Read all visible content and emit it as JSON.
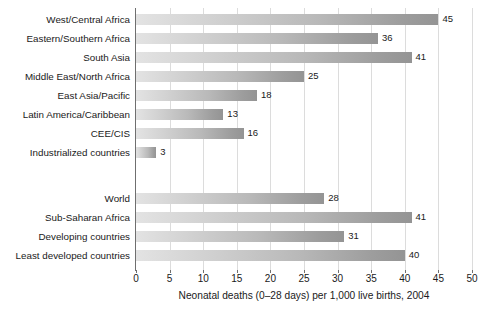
{
  "chart_data": {
    "type": "bar",
    "orientation": "horizontal",
    "title": "",
    "subtitle": "",
    "xlabel": "Neonatal deaths (0–28 days) per 1,000 live births, 2004",
    "ylabel": "",
    "xlim": [
      0,
      50
    ],
    "xticks": [
      0,
      5,
      10,
      15,
      20,
      25,
      30,
      35,
      40,
      45,
      50
    ],
    "xtick_labels": [
      "0",
      "5",
      "10",
      "15",
      "20",
      "25",
      "30",
      "35",
      "40",
      "45",
      "50"
    ],
    "grid": "vertical",
    "legend": "none",
    "bar_color": "#b0b0b0",
    "bar_color_light": "#e3e3e3",
    "bar_color_dark": "#949494",
    "axis_color": "#6f6f6f",
    "gridline_color": "#dcdcdc",
    "categories": [
      "West/Central Africa",
      "Eastern/Southern Africa",
      "South Asia",
      "Middle East/North Africa",
      "East Asia/Pacific",
      "Latin America/Caribbean",
      "CEE/CIS",
      "Industrialized countries",
      "World",
      "Sub-Saharan Africa",
      "Developing countries",
      "Least developed countries"
    ],
    "values": [
      45,
      36,
      41,
      25,
      18,
      13,
      16,
      3,
      28,
      41,
      31,
      40
    ],
    "value_labels": [
      "45",
      "36",
      "41",
      "25",
      "18",
      "13",
      "16",
      "3",
      "28",
      "41",
      "31",
      "40"
    ],
    "groups": [
      {
        "name": "regions",
        "categories": [
          "West/Central Africa",
          "Eastern/Southern Africa",
          "South Asia",
          "Middle East/North Africa",
          "East Asia/Pacific",
          "Latin America/Caribbean",
          "CEE/CIS",
          "Industrialized countries"
        ],
        "values": [
          45,
          36,
          41,
          25,
          18,
          13,
          16,
          3
        ]
      },
      {
        "name": "aggregates",
        "categories": [
          "World",
          "Sub-Saharan Africa",
          "Developing countries",
          "Least developed countries"
        ],
        "values": [
          28,
          41,
          31,
          40
        ]
      }
    ],
    "rows": [
      {
        "label": "West/Central Africa",
        "value": 45,
        "value_label": "45",
        "top": 2,
        "group": 0
      },
      {
        "label": "Eastern/Southern Africa",
        "value": 36,
        "value_label": "36",
        "top": 21,
        "group": 0
      },
      {
        "label": "South Asia",
        "value": 41,
        "value_label": "41",
        "top": 40,
        "group": 0
      },
      {
        "label": "Middle East/North Africa",
        "value": 25,
        "value_label": "25",
        "top": 59,
        "group": 0
      },
      {
        "label": "East Asia/Pacific",
        "value": 18,
        "value_label": "18",
        "top": 78,
        "group": 0
      },
      {
        "label": "Latin America/Caribbean",
        "value": 13,
        "value_label": "13",
        "top": 97,
        "group": 0
      },
      {
        "label": "CEE/CIS",
        "value": 16,
        "value_label": "16",
        "top": 116,
        "group": 0
      },
      {
        "label": "Industrialized countries",
        "value": 3,
        "value_label": "3",
        "top": 135,
        "group": 0
      },
      {
        "label": "World",
        "value": 28,
        "value_label": "28",
        "top": 181,
        "group": 1
      },
      {
        "label": "Sub-Saharan Africa",
        "value": 41,
        "value_label": "41",
        "top": 200,
        "group": 1
      },
      {
        "label": "Developing countries",
        "value": 31,
        "value_label": "31",
        "top": 219,
        "group": 1
      },
      {
        "label": "Least developed countries",
        "value": 40,
        "value_label": "40",
        "top": 238,
        "group": 1
      }
    ]
  }
}
